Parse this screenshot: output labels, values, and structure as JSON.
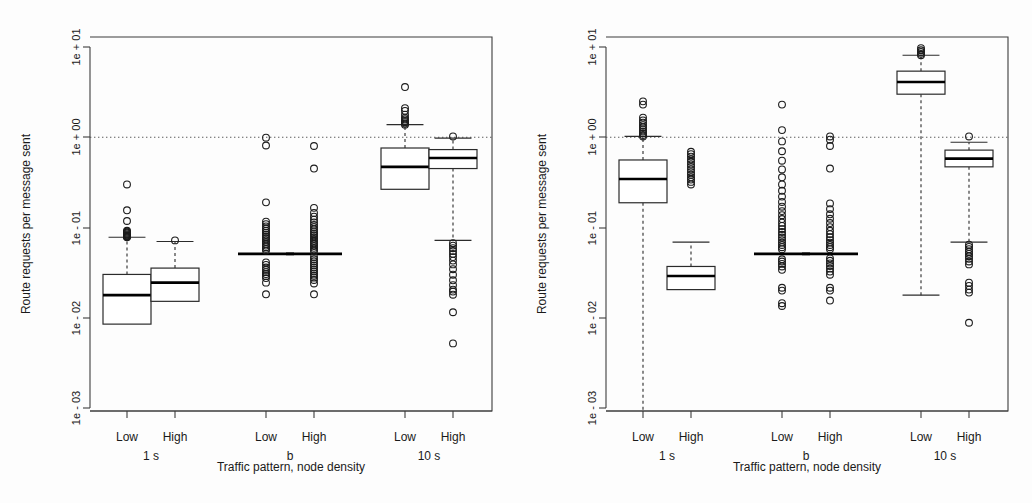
{
  "figure": {
    "title": "",
    "panel_count": 2,
    "background": "#ffffff"
  },
  "chart_data": {
    "type": "box",
    "title": "",
    "xlabel": "Traffic pattern, node density",
    "ylabel": "Route requests per message sent",
    "yscale": "log",
    "ylim": [
      0.0003,
      30
    ],
    "ytick_values": [
      10,
      1,
      0.1,
      0.01,
      0.001
    ],
    "ytick_labels": [
      "1e + 01",
      "1e + 00",
      "1e - 01",
      "1e - 02",
      "1e - 03"
    ],
    "reference_line": {
      "y": 1,
      "style": "dotted",
      "label": "1e + 00"
    },
    "categories": [
      "Low",
      "High",
      "Low",
      "High",
      "Low",
      "High"
    ],
    "group_labels": [
      "1 s",
      "b",
      "10 s"
    ],
    "grid": false,
    "legend": "none",
    "panels": [
      {
        "name": "left-panel",
        "xlabel": "Traffic pattern, node density",
        "ylabel": "Route requests per message sent",
        "boxes": [
          {
            "category": "Low",
            "group": "1 s",
            "q1": 0.0085,
            "median": 0.0178,
            "q3": 0.0302,
            "whisker_low": 0.0085,
            "whisker_high": 0.078,
            "outliers": [
              0.078,
              0.079,
              0.08,
              0.081,
              0.082,
              0.084,
              0.086,
              0.088,
              0.09,
              0.092,
              0.118,
              0.155,
              0.3
            ]
          },
          {
            "category": "High",
            "group": "1 s",
            "q1": 0.0152,
            "median": 0.0245,
            "q3": 0.0355,
            "whisker_low": 0.0152,
            "whisker_high": 0.07,
            "outliers": [
              0.072
            ]
          },
          {
            "category": "Low",
            "group": "b",
            "q1": 0.051,
            "median": 0.051,
            "q3": 0.051,
            "whisker_low": 0.051,
            "whisker_high": 0.051,
            "outliers": [
              0.0182,
              0.0245,
              0.0275,
              0.029,
              0.0305,
              0.032,
              0.034,
              0.036,
              0.0385,
              0.041,
              0.0555,
              0.058,
              0.0605,
              0.063,
              0.066,
              0.069,
              0.072,
              0.0755,
              0.079,
              0.083,
              0.0875,
              0.092,
              0.0975,
              0.103,
              0.109,
              0.116,
              0.19,
              0.81,
              0.99
            ]
          },
          {
            "category": "High",
            "group": "b",
            "q1": 0.051,
            "median": 0.051,
            "q3": 0.051,
            "whisker_low": 0.051,
            "whisker_high": 0.051,
            "outliers": [
              0.0182,
              0.024,
              0.0262,
              0.0278,
              0.0292,
              0.0308,
              0.0325,
              0.0342,
              0.036,
              0.038,
              0.04,
              0.0422,
              0.0445,
              0.047,
              0.0545,
              0.057,
              0.0595,
              0.0622,
              0.065,
              0.068,
              0.0712,
              0.0745,
              0.078,
              0.082,
              0.086,
              0.0905,
              0.0955,
              0.101,
              0.107,
              0.114,
              0.122,
              0.132,
              0.145,
              0.165,
              0.45,
              0.8
            ]
          },
          {
            "category": "Low",
            "group": "10 s",
            "q1": 0.265,
            "median": 0.47,
            "q3": 0.76,
            "whisker_low": 0.265,
            "whisker_high": 1.38,
            "outliers": [
              1.38,
              1.42,
              1.47,
              1.52,
              1.58,
              1.65,
              1.78,
              1.96,
              2.1,
              3.6
            ]
          },
          {
            "category": "High",
            "group": "10 s",
            "q1": 0.45,
            "median": 0.59,
            "q3": 0.73,
            "whisker_low": 0.072,
            "whisker_high": 0.98,
            "outliers": [
              0.0052,
              0.0115,
              0.018,
              0.0195,
              0.0205,
              0.023,
              0.026,
              0.03,
              0.0345,
              0.039,
              0.043,
              0.047,
              0.051,
              0.055,
              0.059,
              0.063,
              0.067,
              1.02
            ]
          }
        ]
      },
      {
        "name": "right-panel",
        "xlabel": "Traffic pattern, node density",
        "ylabel": "Route requests per message sent",
        "boxes": [
          {
            "category": "Low",
            "group": "1 s",
            "q1": 0.188,
            "median": 0.345,
            "q3": 0.56,
            "whisker_low": 0.00035,
            "whisker_high": 1.02,
            "outliers": [
              1.02,
              1.06,
              1.11,
              1.16,
              1.22,
              1.29,
              1.36,
              1.45,
              1.54,
              1.65,
              2.3,
              2.5
            ]
          },
          {
            "category": "High",
            "group": "1 s",
            "q1": 0.0205,
            "median": 0.029,
            "q3": 0.037,
            "whisker_low": 0.0205,
            "whisker_high": 0.069,
            "outliers": [
              0.3,
              0.32,
              0.34,
              0.36,
              0.385,
              0.41,
              0.44,
              0.47,
              0.5,
              0.535,
              0.57,
              0.61,
              0.65,
              0.69
            ]
          },
          {
            "category": "Low",
            "group": "b",
            "q1": 0.051,
            "median": 0.051,
            "q3": 0.051,
            "whisker_low": 0.051,
            "whisker_high": 0.051,
            "outliers": [
              0.0135,
              0.0145,
              0.02,
              0.0215,
              0.034,
              0.037,
              0.0395,
              0.042,
              0.0445,
              0.0575,
              0.0605,
              0.064,
              0.068,
              0.0725,
              0.0775,
              0.083,
              0.089,
              0.096,
              0.104,
              0.113,
              0.124,
              0.137,
              0.152,
              0.17,
              0.192,
              0.22,
              0.255,
              0.3,
              0.36,
              0.44,
              0.55,
              0.7,
              0.9,
              1.2,
              2.3
            ]
          },
          {
            "category": "High",
            "group": "b",
            "q1": 0.051,
            "median": 0.051,
            "q3": 0.051,
            "whisker_low": 0.051,
            "whisker_high": 0.051,
            "outliers": [
              0.0155,
              0.02,
              0.0215,
              0.03,
              0.0325,
              0.035,
              0.0375,
              0.04,
              0.0428,
              0.0455,
              0.0575,
              0.0605,
              0.064,
              0.068,
              0.0725,
              0.078,
              0.0845,
              0.092,
              0.101,
              0.112,
              0.125,
              0.14,
              0.16,
              0.185,
              0.45,
              0.8,
              0.94,
              1.02
            ]
          },
          {
            "category": "Low",
            "group": "10 s",
            "q1": 3.0,
            "median": 4.1,
            "q3": 5.4,
            "whisker_low": 0.0178,
            "whisker_high": 8.1,
            "outliers": [
              8.1,
              8.4,
              8.8,
              9.2,
              9.7
            ]
          },
          {
            "category": "High",
            "group": "10 s",
            "q1": 0.47,
            "median": 0.58,
            "q3": 0.72,
            "whisker_low": 0.069,
            "whisker_high": 0.88,
            "outliers": [
              0.0088,
              0.019,
              0.0205,
              0.0225,
              0.0245,
              0.039,
              0.042,
              0.045,
              0.048,
              0.051,
              0.054,
              0.0575,
              0.061,
              0.0645,
              1.02
            ]
          }
        ]
      }
    ]
  }
}
